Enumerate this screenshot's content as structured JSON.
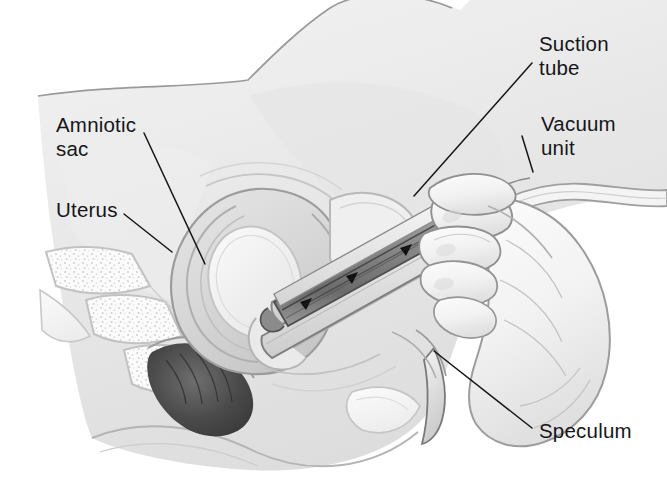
{
  "figure": {
    "kind": "medical-illustration",
    "style": "grayscale pencil and airbrush rendering",
    "background_color": "#ffffff",
    "ink_color": "#16161a",
    "tissue_tone": "#ececec",
    "width": 667,
    "height": 498
  },
  "labels": [
    {
      "id": "amniotic-sac",
      "text": "Amniotic\nsac",
      "lines": [
        "Amniotic",
        "sac"
      ],
      "x": 56,
      "y": 113,
      "leader": {
        "x1": 144,
        "y1": 133,
        "x2": 205,
        "y2": 264
      }
    },
    {
      "id": "uterus",
      "text": "Uterus",
      "lines": [
        "Uterus"
      ],
      "x": 56,
      "y": 198,
      "leader": {
        "x1": 124,
        "y1": 214,
        "x2": 172,
        "y2": 252
      }
    },
    {
      "id": "suction-tube",
      "text": "Suction\ntube",
      "lines": [
        "Suction",
        "tube"
      ],
      "x": 539,
      "y": 32,
      "leader": {
        "x1": 532,
        "y1": 63,
        "x2": 414,
        "y2": 196
      }
    },
    {
      "id": "vacuum-unit",
      "text": "Vacuum\nunit",
      "lines": [
        "Vacuum",
        "unit"
      ],
      "x": 541,
      "y": 112,
      "leader": {
        "x1": 533,
        "y1": 172,
        "x2": 522,
        "y2": 136
      }
    },
    {
      "id": "speculum",
      "text": "Speculum",
      "lines": [
        "Speculum"
      ],
      "x": 539,
      "y": 419,
      "leader": {
        "x1": 434,
        "y1": 351,
        "x2": 532,
        "y2": 428
      }
    }
  ],
  "anatomy": [
    {
      "name": "abdominal-wall",
      "description": "outer body contour of lower abdomen and thigh"
    },
    {
      "name": "uterus",
      "description": "enlarged gravid uterus in sagittal section"
    },
    {
      "name": "amniotic-sac",
      "description": "pale oval sac inside uterine cavity"
    },
    {
      "name": "cervix",
      "description": "cervical canal through which tube passes"
    },
    {
      "name": "vagina",
      "description": "vaginal canal held open by speculum"
    },
    {
      "name": "bladder",
      "description": "bladder anterior to uterus"
    },
    {
      "name": "rectum",
      "description": "dark shaded rectum posterior to uterus"
    },
    {
      "name": "sacrum-vertebrae",
      "description": "sacral vertebrae with trabecular bone texture, lower left"
    },
    {
      "name": "pubic-bone",
      "description": "pubic symphysis cross-section"
    }
  ],
  "instruments": [
    {
      "name": "suction-tube",
      "description": "straight cannula inserted through cervix into uterus"
    },
    {
      "name": "vacuum-unit",
      "description": "flexible tubing running off to the right edge"
    },
    {
      "name": "speculum",
      "description": "bivalve speculum opening the vaginal canal"
    },
    {
      "name": "gloved-hand",
      "description": "clinician's gloved hand gripping the cannula at right"
    }
  ],
  "flow_arrows": {
    "description": "solid black arrowheads inside the suction tube indicating aspiration direction toward the vacuum unit",
    "count": 4,
    "direction": "out of uterus toward vacuum unit"
  }
}
